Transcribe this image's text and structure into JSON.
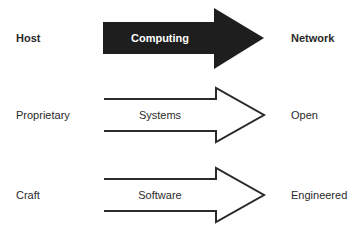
{
  "diagram": {
    "rows": [
      {
        "from": "Host",
        "arrow_label": "Computing",
        "to": "Network",
        "style": "filled"
      },
      {
        "from": "Proprietary",
        "arrow_label": "Systems",
        "to": "Open",
        "style": "outline"
      },
      {
        "from": "Craft",
        "arrow_label": "Software",
        "to": "Engineered",
        "style": "outline"
      }
    ],
    "colors": {
      "filled_arrow": "#1e1e1e",
      "outline_stroke": "#2a2a2a",
      "text": "#2a2a2a",
      "background": "#ffffff"
    }
  }
}
